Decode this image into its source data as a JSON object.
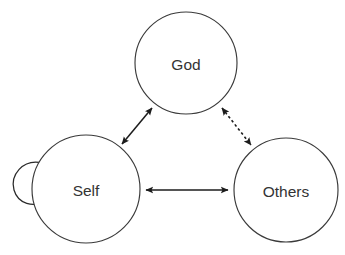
{
  "diagram": {
    "background_color": "#ffffff",
    "node_stroke_color": "#3a3a3a",
    "node_fill_color": "#ffffff",
    "edge_color": "#1c1c1c",
    "label_color": "#333333",
    "nodes": [
      {
        "id": "god",
        "label": "God",
        "cx": 186,
        "cy": 63,
        "r": 51
      },
      {
        "id": "self",
        "label": "Self",
        "cx": 86,
        "cy": 189,
        "r": 54
      },
      {
        "id": "others",
        "label": "Others",
        "cx": 286,
        "cy": 190,
        "r": 52
      }
    ],
    "edges": [
      {
        "id": "self-god",
        "from": "self",
        "to": "god",
        "style": "solid",
        "arrows": "both",
        "label": ""
      },
      {
        "id": "god-others",
        "from": "god",
        "to": "others",
        "style": "dotted",
        "arrows": "both",
        "label": ""
      },
      {
        "id": "self-others",
        "from": "self",
        "to": "others",
        "style": "solid",
        "arrows": "both",
        "label": ""
      },
      {
        "id": "self-self",
        "from": "self",
        "to": "self",
        "style": "solid",
        "arrows": "single",
        "label": ""
      }
    ]
  }
}
